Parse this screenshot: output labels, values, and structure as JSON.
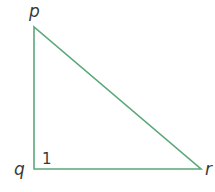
{
  "diagram": {
    "type": "right-triangle",
    "line_color": "#5aa87a",
    "vertices": [
      {
        "id": "p",
        "label": "p",
        "x": 34,
        "y": 27
      },
      {
        "id": "q",
        "label": "q",
        "x": 34,
        "y": 169
      },
      {
        "id": "r",
        "label": "r",
        "x": 201,
        "y": 169
      }
    ],
    "angle_label": {
      "at": "q",
      "text": "1"
    }
  }
}
